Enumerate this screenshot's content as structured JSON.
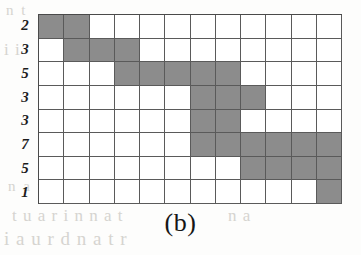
{
  "figure": {
    "caption": "(b)",
    "colors": {
      "filled_cell": "#8c8c8c",
      "empty_cell": "#ffffff",
      "grid_line": "#5a5a5a",
      "label_text": "#1c1c1c",
      "page_background": "#fdfdfc",
      "bleed_through_text": "#c9c7c2"
    }
  },
  "chart_data": {
    "type": "heatmap",
    "title": "(b)",
    "xlabel": "",
    "ylabel": "",
    "rows": 8,
    "columns": 12,
    "grid": true,
    "legend": "none",
    "row_labels": [
      "2",
      "3",
      "5",
      "3",
      "3",
      "7",
      "5",
      "1"
    ],
    "column_labels": [
      "1",
      "2",
      "3",
      "4",
      "5",
      "6",
      "7",
      "8",
      "9",
      "10",
      "11",
      "12"
    ],
    "values": [
      [
        1,
        1,
        0,
        0,
        0,
        0,
        0,
        0,
        0,
        0,
        0,
        0
      ],
      [
        0,
        1,
        1,
        1,
        0,
        0,
        0,
        0,
        0,
        0,
        0,
        0
      ],
      [
        0,
        0,
        0,
        1,
        1,
        1,
        1,
        1,
        0,
        0,
        0,
        0
      ],
      [
        0,
        0,
        0,
        0,
        0,
        0,
        1,
        1,
        1,
        0,
        0,
        0
      ],
      [
        0,
        0,
        0,
        0,
        0,
        0,
        1,
        1,
        0,
        0,
        0,
        0
      ],
      [
        0,
        0,
        0,
        0,
        0,
        0,
        1,
        1,
        1,
        1,
        1,
        1
      ],
      [
        0,
        0,
        0,
        0,
        0,
        0,
        0,
        0,
        1,
        1,
        1,
        1
      ],
      [
        0,
        0,
        0,
        0,
        0,
        0,
        0,
        0,
        0,
        0,
        0,
        1
      ]
    ],
    "row_filled_counts": [
      2,
      3,
      5,
      3,
      2,
      6,
      4,
      1
    ],
    "value_legend": {
      "1": "shaded cell",
      "0": "empty cell"
    }
  },
  "background_text": {
    "line_1": "n t",
    "line_2": "i i",
    "line_3": "i a mu t u",
    "line_4": "n  a t",
    "line_5": "t u  a  r  i n n  a  t",
    "line_6": "i a u  r d  n  a  t  r",
    "line_7": "n  a"
  }
}
